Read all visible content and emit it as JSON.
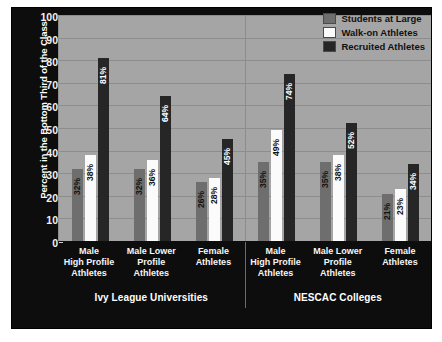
{
  "chart_data": {
    "type": "bar",
    "title": "",
    "xlabel": "",
    "ylabel": "Percent in the Bottom Third of the Class",
    "ylim": [
      0,
      100
    ],
    "ytick_step": 10,
    "yticks": [
      100,
      90,
      80,
      70,
      60,
      50,
      40,
      30,
      20,
      10,
      0
    ],
    "grid": true,
    "legend_position": "top-right",
    "categories": [
      "Male High Profile Athletes",
      "Male Lower Profile Athletes",
      "Female Athletes"
    ],
    "panels": [
      {
        "title": "Ivy League Universities",
        "categories": [
          "Male High Profile Athletes",
          "Male Lower Profile Athletes",
          "Female Athletes"
        ],
        "series": [
          {
            "name": "Students at Large",
            "values": [
              32,
              32,
              26
            ],
            "labels": [
              "32%",
              "32%",
              "26%"
            ]
          },
          {
            "name": "Walk-on Athletes",
            "values": [
              38,
              36,
              28
            ],
            "labels": [
              "38%",
              "36%",
              "28%"
            ]
          },
          {
            "name": "Recruited Athletes",
            "values": [
              81,
              64,
              45
            ],
            "labels": [
              "81%",
              "64%",
              "45%"
            ]
          }
        ]
      },
      {
        "title": "NESCAC Colleges",
        "categories": [
          "Male High Profile Athletes",
          "Male Lower Profile Athletes",
          "Female Athletes"
        ],
        "series": [
          {
            "name": "Students at Large",
            "values": [
              35,
              35,
              21
            ],
            "labels": [
              "35%",
              "35%",
              "21%"
            ]
          },
          {
            "name": "Walk-on Athletes",
            "values": [
              49,
              38,
              23
            ],
            "labels": [
              "49%",
              "38%",
              "23%"
            ]
          },
          {
            "name": "Recruited Athletes",
            "values": [
              74,
              52,
              34
            ],
            "labels": [
              "74%",
              "52%",
              "34%"
            ]
          }
        ]
      }
    ],
    "legend": [
      {
        "label": "Students at Large",
        "color": "#6e6e6e"
      },
      {
        "label": "Walk-on Athletes",
        "color": "#fbfbfb"
      },
      {
        "label": "Recruited Athletes",
        "color": "#262626"
      }
    ],
    "colors": {
      "figure_background": "#0d0d0d",
      "plot_background": "#a5a5a5",
      "gridline": "#8d8d8d",
      "axis_text": "#f2f2f2",
      "page_background": "#ffffff"
    }
  },
  "x_category_lines": [
    [
      "Male",
      "High Profile",
      "Athletes"
    ],
    [
      "Male Lower",
      "Profile",
      "Athletes"
    ],
    [
      "Female",
      "Athletes"
    ]
  ]
}
